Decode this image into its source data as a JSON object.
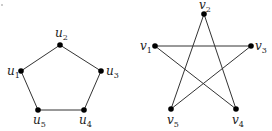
{
  "graphs": [
    {
      "name": "pentagon-graph",
      "vertices": [
        {
          "id": "u1",
          "base": "u",
          "sub": "1",
          "x": 21,
          "y": 71,
          "lx": 7,
          "ly": 75
        },
        {
          "id": "u2",
          "base": "u",
          "sub": "2",
          "x": 60,
          "y": 45,
          "lx": 55,
          "ly": 37
        },
        {
          "id": "u3",
          "base": "u",
          "sub": "3",
          "x": 101,
          "y": 71,
          "lx": 106,
          "ly": 75
        },
        {
          "id": "u4",
          "base": "u",
          "sub": "4",
          "x": 84,
          "y": 110,
          "lx": 79,
          "ly": 124
        },
        {
          "id": "u5",
          "base": "u",
          "sub": "5",
          "x": 38,
          "y": 110,
          "lx": 33,
          "ly": 124
        }
      ],
      "edges": [
        [
          "u1",
          "u2"
        ],
        [
          "u2",
          "u3"
        ],
        [
          "u3",
          "u4"
        ],
        [
          "u4",
          "u5"
        ],
        [
          "u5",
          "u1"
        ]
      ]
    },
    {
      "name": "star-graph",
      "vertices": [
        {
          "id": "v1",
          "base": "v",
          "sub": "1",
          "x": 155,
          "y": 46,
          "lx": 140,
          "ly": 50
        },
        {
          "id": "v2",
          "base": "v",
          "sub": "2",
          "x": 204,
          "y": 14,
          "lx": 199,
          "ly": 9
        },
        {
          "id": "v3",
          "base": "v",
          "sub": "3",
          "x": 251,
          "y": 46,
          "lx": 255,
          "ly": 50
        },
        {
          "id": "v4",
          "base": "v",
          "sub": "4",
          "x": 236,
          "y": 109,
          "lx": 232,
          "ly": 124
        },
        {
          "id": "v5",
          "base": "v",
          "sub": "5",
          "x": 171,
          "y": 109,
          "lx": 167,
          "ly": 124
        }
      ],
      "edges": [
        [
          "v1",
          "v3"
        ],
        [
          "v1",
          "v4"
        ],
        [
          "v2",
          "v4"
        ],
        [
          "v2",
          "v5"
        ],
        [
          "v3",
          "v5"
        ]
      ]
    }
  ],
  "colors": {
    "edge": "#333333",
    "node": "#000000",
    "label": "#222222"
  }
}
